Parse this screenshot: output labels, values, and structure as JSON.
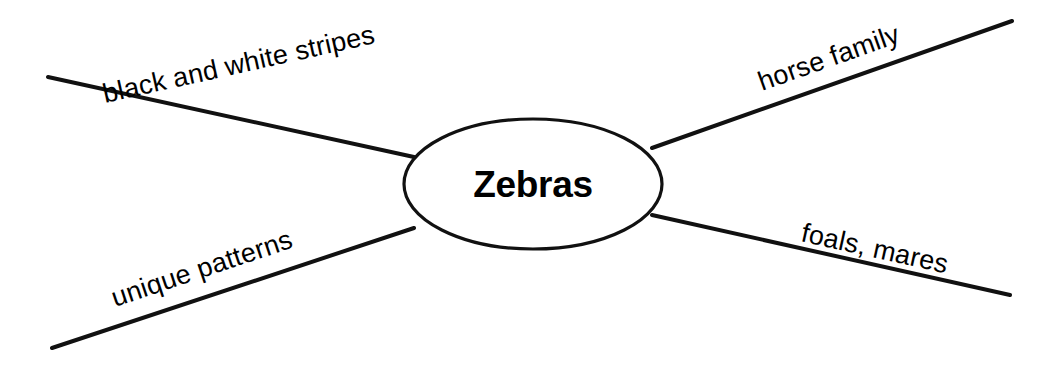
{
  "diagram": {
    "type": "concept-map",
    "background_color": "#ffffff",
    "line_color": "#111111",
    "text_color": "#000000",
    "center": {
      "label": "Zebras",
      "shape": "ellipse",
      "cx": 533,
      "cy": 184,
      "rx": 129,
      "ry": 65
    },
    "branches": [
      {
        "id": "black-and-white-stripes",
        "label": "black and white stripes",
        "position": "top-left",
        "line": {
          "x1": 48,
          "y1": 77,
          "x2": 414,
          "y2": 157
        },
        "label_x": 105,
        "label_y": 103,
        "label_rotation": -12.5
      },
      {
        "id": "horse-family",
        "label": "horse family",
        "position": "top-right",
        "line": {
          "x1": 652,
          "y1": 148,
          "x2": 1012,
          "y2": 21
        },
        "label_x": 762,
        "label_y": 91,
        "label_rotation": -19.5
      },
      {
        "id": "foals-mares",
        "label": "foals, mares",
        "position": "bottom-right",
        "line": {
          "x1": 652,
          "y1": 215,
          "x2": 1010,
          "y2": 295
        },
        "label_x": 800,
        "label_y": 241,
        "label_rotation": 12.5
      },
      {
        "id": "unique-patterns",
        "label": "unique patterns",
        "position": "bottom-left",
        "line": {
          "x1": 52,
          "y1": 348,
          "x2": 414,
          "y2": 228
        },
        "label_x": 115,
        "label_y": 307,
        "label_rotation": -18.5
      }
    ]
  }
}
